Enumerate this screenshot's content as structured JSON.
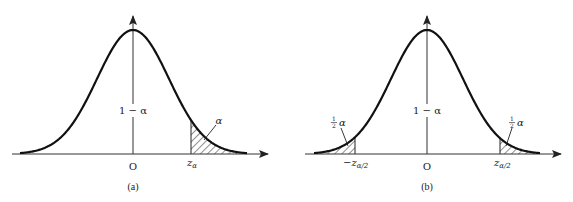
{
  "figure": {
    "panels": [
      {
        "id": "a",
        "caption": "(a)",
        "origin_label": "O",
        "center_label": "1 − α",
        "tail_label": "α",
        "critical_value_label": "z",
        "critical_value_sub": "α",
        "shaded": "right tail"
      },
      {
        "id": "b",
        "caption": "(b)",
        "origin_label": "O",
        "center_label": "1 − α",
        "left_tail_label_frac": "1/2",
        "left_tail_label_sym": "α",
        "right_tail_label_frac": "1/2",
        "right_tail_label_sym": "α",
        "left_critical_label": "−z",
        "left_critical_sub": "α/2",
        "right_critical_label": "z",
        "right_critical_sub": "α/2",
        "shaded": "both tails"
      }
    ],
    "colors": {
      "curve": "#111111",
      "axis": "#333333",
      "hatch": "#222222",
      "background": "#ffffff"
    }
  }
}
